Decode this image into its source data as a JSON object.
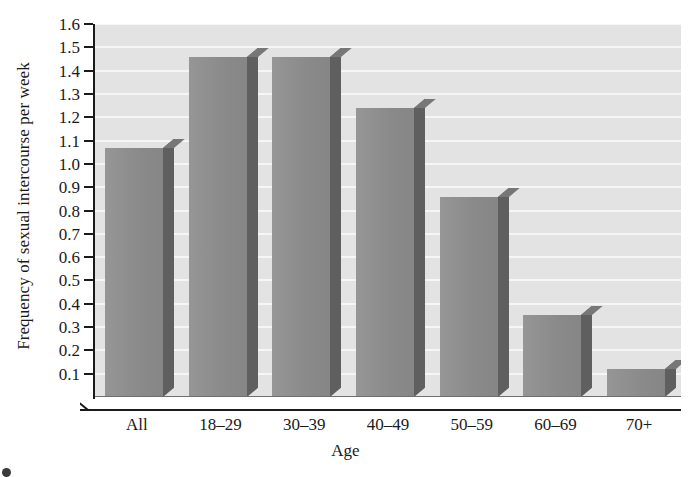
{
  "chart_data": {
    "type": "bar",
    "title": "",
    "xlabel": "Age",
    "ylabel": "Frequency of sexual intercourse per week",
    "categories": [
      "All",
      "18–29",
      "30–39",
      "40–49",
      "50–59",
      "60–69",
      "70+"
    ],
    "values": [
      1.07,
      1.46,
      1.46,
      1.24,
      0.86,
      0.35,
      0.12
    ],
    "ylim": [
      0.0,
      1.6
    ],
    "ytick_labels": [
      "1.6",
      "1.5",
      "1.4",
      "1.3",
      "1.2",
      "1.1",
      "1.0",
      "0.9",
      "0.8",
      "0.7",
      "0.6",
      "0.5",
      "0.4",
      "0.3",
      "0.2",
      "0.1"
    ],
    "ytick_values": [
      1.6,
      1.5,
      1.4,
      1.3,
      1.2,
      1.1,
      1.0,
      0.9,
      0.8,
      0.7,
      0.6,
      0.5,
      0.4,
      0.3,
      0.2,
      0.1
    ],
    "grid": true,
    "grid_orientation": "horizontal",
    "legend": null,
    "style": "3d-bar",
    "colors": {
      "bar_front": "#8e8e8e",
      "bar_side": "#5f5f5f",
      "bar_top": "#777777",
      "plot_background": "#e3e3e3",
      "gridline": "#f6f6f6",
      "axis": "#1a1a1a",
      "text": "#1a1a1a",
      "page_background": "#ffffff"
    }
  },
  "caption": {
    "text": "",
    "visible": false
  }
}
